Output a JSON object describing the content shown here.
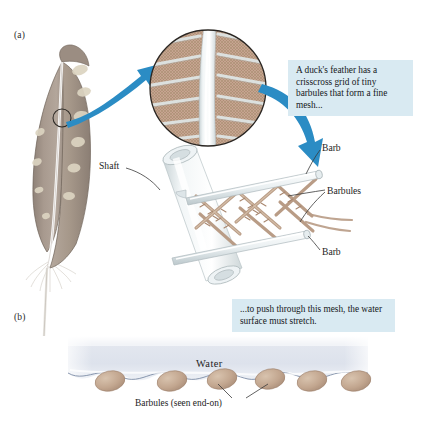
{
  "figure": {
    "panels": [
      {
        "id": "a",
        "label": "(a)"
      },
      {
        "id": "b",
        "label": "(b)"
      }
    ]
  },
  "callouts": [
    {
      "id": "top",
      "text": "A duck's feather has a crisscross grid of tiny barbules that form a fine mesh...",
      "bg": "#d9eaf2"
    },
    {
      "id": "bottom",
      "text": "...to push through this mesh, the water surface must stretch.",
      "bg": "#d9eaf2"
    }
  ],
  "labels": {
    "shaft": "Shaft",
    "barb_top": "Barb",
    "barbules": "Barbules",
    "barb_bottom": "Barb",
    "water": "Water",
    "barbules_end_on": "Barbules (seen end-on)"
  },
  "colors": {
    "background": "#ffffff",
    "arrow_blue": "#2b8cc4",
    "callout_bg": "#d9eaf2",
    "feather_vane": "#a4968c",
    "feather_speckle": "#ded6c3",
    "feather_rachis": "#f4f2ee",
    "barbule_tan": "#bfa48e",
    "barb_tube": "#e8edef",
    "water_fill": "#dfe4ee",
    "water_line": "#8d9bb4",
    "mesh_brown": "#b59684",
    "leader_line": "#3a3a3a"
  },
  "panel_b": {
    "barbule_count": 6,
    "barbule_positions_px": [
      110,
      172,
      222,
      270,
      312,
      352
    ],
    "water_top_px": 336,
    "water_surface_px": 376
  },
  "inset": {
    "shape": "circle",
    "description": "magnified circular view of feather vane showing central shaft, angled barbs and fine mesh",
    "center_px": [
      208,
      88
    ],
    "radius_px": 58
  }
}
